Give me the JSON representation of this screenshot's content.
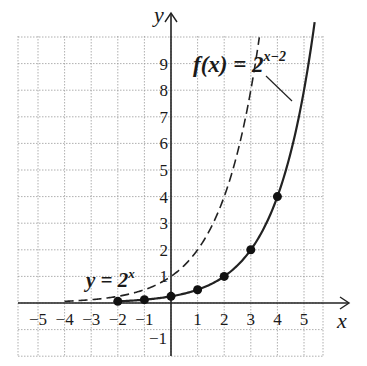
{
  "chart_data": {
    "type": "line",
    "title": "",
    "xlabel": "x",
    "ylabel": "y",
    "xlim": [
      -6,
      6.5
    ],
    "ylim": [
      -2,
      10.5
    ],
    "grid": true,
    "x_ticks": [
      "-5",
      "-4",
      "-3",
      "-2",
      "-1",
      "1",
      "2",
      "3",
      "4",
      "5"
    ],
    "y_ticks": [
      "-1",
      "1",
      "2",
      "3",
      "4",
      "5",
      "6",
      "7",
      "8",
      "9"
    ],
    "series": [
      {
        "name": "y = 2^x",
        "style": "dashed",
        "function": "2^x",
        "x_range": [
          -4,
          3.32
        ]
      },
      {
        "name": "f(x) = 2^(x-2)",
        "style": "solid",
        "function": "2^(x-2)",
        "x_range": [
          -2,
          5.4
        ],
        "points": [
          {
            "x": -2,
            "y": 0.0625
          },
          {
            "x": -1,
            "y": 0.125
          },
          {
            "x": 0,
            "y": 0.25
          },
          {
            "x": 1,
            "y": 0.5
          },
          {
            "x": 2,
            "y": 1
          },
          {
            "x": 3,
            "y": 2
          },
          {
            "x": 4,
            "y": 4
          }
        ]
      }
    ],
    "annotations": [
      {
        "text": "f(x) = 2",
        "sup": "x−2",
        "near": "solid curve"
      },
      {
        "text": "y = 2",
        "sup": "x",
        "near": "dashed curve"
      }
    ]
  },
  "labels": {
    "x_axis": "x",
    "y_axis": "y",
    "f_label_base": "f(x) = 2",
    "f_label_sup": "x−2",
    "g_label_base": "y = 2",
    "g_label_sup": "x"
  }
}
